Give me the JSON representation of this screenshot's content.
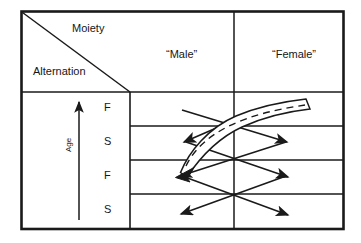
{
  "figure": {
    "type": "diagram"
  },
  "header": {
    "corner": {
      "upper_right_label": "Moiety",
      "lower_left_label": "Alternation",
      "divider": "diagonal-line"
    },
    "columns": [
      {
        "label": "“Male”"
      },
      {
        "label": "“Female”"
      }
    ]
  },
  "axis": {
    "label": "Age",
    "direction": "up",
    "arrow_icon": "up-arrow-icon"
  },
  "rows": [
    {
      "label": "F"
    },
    {
      "label": "S"
    },
    {
      "label": "F"
    },
    {
      "label": "S"
    }
  ],
  "annotations": {
    "ribbon": {
      "name": "curved-ribbon",
      "style": "outlined band with dashed centerline",
      "arrow_end": "lower-left"
    },
    "zigzag_arrows": {
      "name": "alternating-descent-arrows",
      "count": 6,
      "style": "single-headed straight arrows crossing between columns"
    }
  },
  "colors": {
    "line": "#1a1a1a",
    "background": "#ffffff",
    "grid": "#3a3a3a"
  }
}
